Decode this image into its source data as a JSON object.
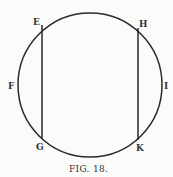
{
  "figure": {
    "caption": "Fig. 18.",
    "caption_display": "FIG. 18.",
    "circle": {
      "cx": 90,
      "cy": 85,
      "r": 72
    },
    "chords": [
      {
        "name": "EG",
        "from": "E",
        "to": "G",
        "x": 42,
        "y1": 24,
        "y2": 138
      },
      {
        "name": "HK",
        "from": "H",
        "to": "K",
        "x": 138,
        "y1": 28,
        "y2": 140
      }
    ],
    "labels": {
      "E": "E",
      "H": "H",
      "F": "F",
      "I": "I",
      "G": "G",
      "K": "K"
    },
    "colors": {
      "stroke": "#2a2a2a",
      "background": "#fbfbfa"
    }
  }
}
